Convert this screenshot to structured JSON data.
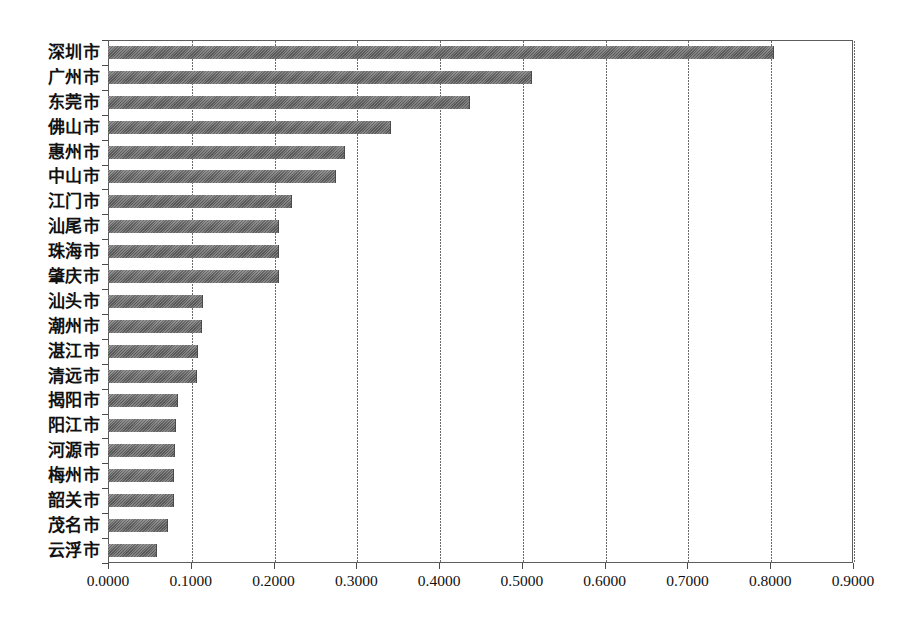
{
  "chart_data": {
    "type": "bar",
    "orientation": "horizontal",
    "title": "",
    "subtitle": "",
    "xlabel": "",
    "ylabel": "",
    "xlim": [
      0.0,
      0.9
    ],
    "xticks": [
      0.0,
      0.1,
      0.2,
      0.3,
      0.4,
      0.5,
      0.6,
      0.7,
      0.8,
      0.9
    ],
    "xtick_labels": [
      "0.0000",
      "0.1000",
      "0.2000",
      "0.3000",
      "0.4000",
      "0.5000",
      "0.6000",
      "0.7000",
      "0.8000",
      "0.9000"
    ],
    "grid": "vertical",
    "legend": "none",
    "bar_color": "#6a6a6a",
    "categories": [
      "深圳市",
      "广州市",
      "东莞市",
      "佛山市",
      "惠州市",
      "中山市",
      "江门市",
      "汕尾市",
      "珠海市",
      "肇庆市",
      "汕头市",
      "潮州市",
      "湛江市",
      "清远市",
      "揭阳市",
      "阳江市",
      "河源市",
      "梅州市",
      "韶关市",
      "茂名市",
      "云浮市"
    ],
    "values": [
      0.805,
      0.512,
      0.437,
      0.342,
      0.286,
      0.276,
      0.222,
      0.207,
      0.207,
      0.206,
      0.115,
      0.113,
      0.109,
      0.107,
      0.084,
      0.082,
      0.081,
      0.08,
      0.08,
      0.072,
      0.059
    ],
    "series": [
      {
        "name": "",
        "values": [
          0.805,
          0.512,
          0.437,
          0.342,
          0.286,
          0.276,
          0.222,
          0.207,
          0.207,
          0.206,
          0.115,
          0.113,
          0.109,
          0.107,
          0.084,
          0.082,
          0.081,
          0.08,
          0.08,
          0.072,
          0.059
        ]
      }
    ]
  }
}
